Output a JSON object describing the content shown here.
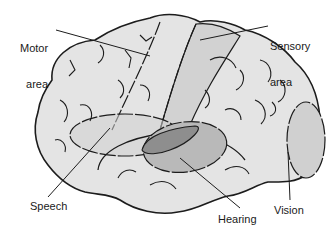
{
  "diagram": {
    "labels": {
      "motor": {
        "line1": "Motor",
        "line2": "area"
      },
      "sensory": {
        "line1": "Sensory",
        "line2": "area"
      },
      "speech": "Speech",
      "hearing": "Hearing",
      "vision": "Vision"
    },
    "colors": {
      "background": "#ffffff",
      "brain_fill": "#e4e4e4",
      "outline": "#1c1c1c",
      "sensory_band": "#d2d2d2",
      "speech_region": "#cfcfcf",
      "hearing_outer": "#b9b9b9",
      "hearing_inner": "#8e8e8e",
      "vision_region": "#d0d0d0"
    }
  }
}
